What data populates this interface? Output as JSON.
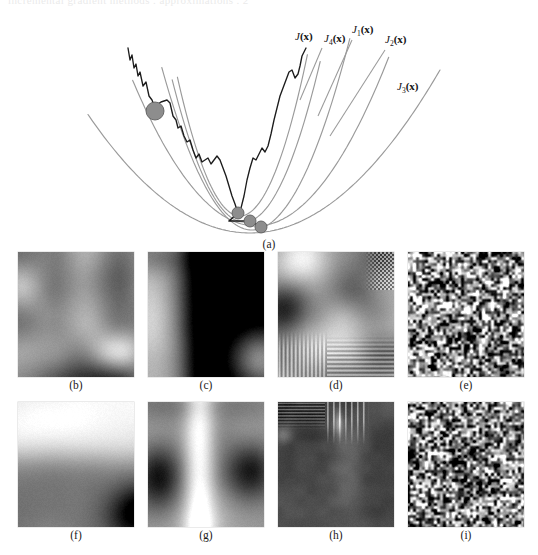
{
  "figure": {
    "cropped_header_text": "incremental gradient methods  .  approximations  .  2",
    "panel_a": {
      "caption": "(a)",
      "curve_labels": [
        {
          "id": "J",
          "text": "J(x)",
          "x": 295,
          "y": 32
        },
        {
          "id": "J4",
          "text": "J",
          "sub": "4",
          "tail": "(x)",
          "x": 324,
          "y": 34
        },
        {
          "id": "J1",
          "text": "J",
          "sub": "1",
          "tail": "(x)",
          "x": 352,
          "y": 25
        },
        {
          "id": "J2",
          "text": "J",
          "sub": "2",
          "tail": "(x)",
          "x": 385,
          "y": 35
        },
        {
          "id": "J3",
          "text": "J",
          "sub": "3",
          "tail": "(x)",
          "x": 397,
          "y": 82
        }
      ],
      "colors": {
        "approx_curve": "#9a9a9a",
        "true_curve": "#1c1c1c",
        "ball_fill": "#8d8d8d",
        "ball_stroke": "#5e5e5e"
      },
      "ball_positions": [
        {
          "x": 155,
          "y": 103,
          "r": 9
        },
        {
          "x": 238,
          "y": 205,
          "r": 6
        },
        {
          "x": 250,
          "y": 213,
          "r": 6
        },
        {
          "x": 261,
          "y": 219,
          "r": 6
        }
      ],
      "num_approx_curves": 5
    },
    "image_panels": [
      {
        "caption": "(b)",
        "kind": "blur-soft",
        "row": 1,
        "col": 1,
        "seed": 11
      },
      {
        "caption": "(c)",
        "kind": "blur-contrast",
        "row": 1,
        "col": 2,
        "seed": 23
      },
      {
        "caption": "(d)",
        "kind": "stripes-mixed",
        "row": 1,
        "col": 3,
        "seed": 37
      },
      {
        "caption": "(e)",
        "kind": "noise",
        "row": 1,
        "col": 4,
        "seed": 51
      },
      {
        "caption": "(f)",
        "kind": "blur-bright",
        "row": 2,
        "col": 1,
        "seed": 67
      },
      {
        "caption": "(g)",
        "kind": "blur-band",
        "row": 2,
        "col": 2,
        "seed": 83
      },
      {
        "caption": "(h)",
        "kind": "dark-stripes",
        "row": 2,
        "col": 3,
        "seed": 97
      },
      {
        "caption": "(i)",
        "kind": "noise",
        "row": 2,
        "col": 4,
        "seed": 109
      }
    ]
  },
  "chart_data": {
    "type": "line",
    "title": "",
    "xlabel": "",
    "ylabel": "",
    "grid": false,
    "legend": "inline-labels",
    "series": [
      {
        "name": "J(x)",
        "style": "jagged-dark",
        "color": "#1c1c1c",
        "points": [
          [
            128,
            40
          ],
          [
            130,
            52
          ],
          [
            132,
            47
          ],
          [
            134,
            60
          ],
          [
            136,
            56
          ],
          [
            138,
            68
          ],
          [
            140,
            64
          ],
          [
            143,
            78
          ],
          [
            146,
            74
          ],
          [
            149,
            88
          ],
          [
            152,
            92
          ],
          [
            155,
            100
          ],
          [
            158,
            96
          ],
          [
            161,
            94
          ],
          [
            164,
            93
          ],
          [
            167,
            92
          ],
          [
            170,
            95
          ],
          [
            173,
            108
          ],
          [
            176,
            112
          ],
          [
            178,
            120
          ],
          [
            181,
            118
          ],
          [
            184,
            128
          ],
          [
            187,
            134
          ],
          [
            190,
            132
          ],
          [
            193,
            142
          ],
          [
            196,
            150
          ],
          [
            199,
            146
          ],
          [
            202,
            154
          ],
          [
            205,
            152
          ],
          [
            208,
            150
          ],
          [
            211,
            156
          ],
          [
            214,
            152
          ],
          [
            217,
            148
          ],
          [
            220,
            152
          ],
          [
            223,
            160
          ],
          [
            226,
            168
          ],
          [
            229,
            178
          ],
          [
            232,
            188
          ],
          [
            235,
            196
          ],
          [
            238,
            205
          ],
          [
            241,
            200
          ],
          [
            244,
            188
          ],
          [
            247,
            172
          ],
          [
            250,
            160
          ],
          [
            253,
            150
          ],
          [
            256,
            152
          ],
          [
            259,
            146
          ],
          [
            262,
            140
          ],
          [
            265,
            144
          ],
          [
            268,
            138
          ],
          [
            271,
            126
          ],
          [
            274,
            112
          ],
          [
            277,
            100
          ],
          [
            280,
            88
          ],
          [
            283,
            80
          ],
          [
            286,
            72
          ],
          [
            289,
            64
          ],
          [
            292,
            62
          ],
          [
            295,
            70
          ],
          [
            298,
            66
          ],
          [
            300,
            58
          ],
          [
            302,
            48
          ],
          [
            304,
            44
          ],
          [
            306,
            40
          ]
        ]
      },
      {
        "name": "J1(x)",
        "style": "smooth-quadratic",
        "color": "#9a9a9a",
        "vertex": [
          252,
          222
        ],
        "right_end": [
          350,
          30
        ]
      },
      {
        "name": "J2(x)",
        "style": "smooth-quadratic",
        "color": "#9a9a9a",
        "vertex": [
          256,
          218
        ],
        "right_end": [
          390,
          46
        ]
      },
      {
        "name": "J3(x)",
        "style": "smooth-quadratic",
        "color": "#9a9a9a",
        "vertex": [
          250,
          225
        ],
        "right_end": [
          440,
          62
        ]
      },
      {
        "name": "J4(x)",
        "style": "smooth-quadratic",
        "color": "#9a9a9a",
        "vertex": [
          244,
          214
        ],
        "right_end": [
          322,
          46
        ]
      },
      {
        "name": "J5(x)",
        "style": "smooth-quadratic",
        "color": "#9a9a9a",
        "vertex": [
          240,
          208
        ],
        "right_end": [
          308,
          44
        ]
      }
    ]
  }
}
